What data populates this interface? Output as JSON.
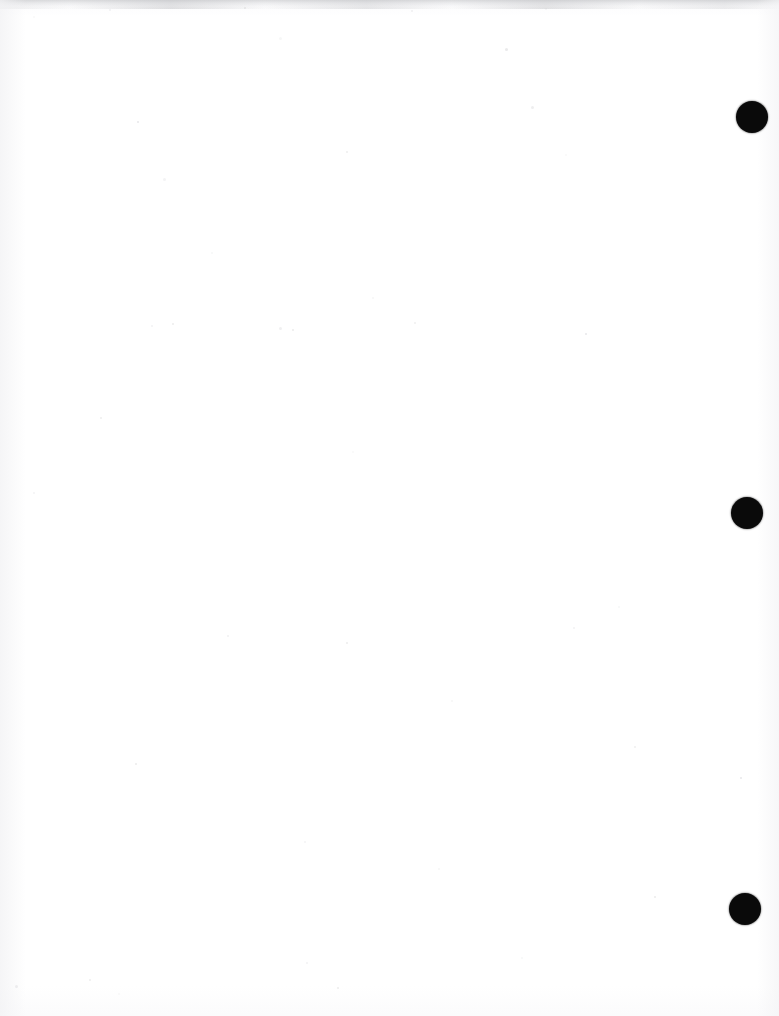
{
  "document": {
    "type": "scanned-page",
    "title": "Scanned Blank Page",
    "page_width": 779,
    "page_height": 1016,
    "background_color": "#ffffff",
    "body_text": "",
    "content_note": "Blank page — no printed text or figures"
  },
  "scan_artifacts": {
    "top_band": {
      "label": "top-edge-scan-band",
      "color": "#c4c5c8",
      "height": 9
    },
    "edge_shading_color": "#f2f2f4",
    "speck_color": "#b9babe",
    "specks": [
      {
        "x": 33,
        "y": 16,
        "size": 2
      },
      {
        "x": 109,
        "y": 9,
        "size": 2
      },
      {
        "x": 244,
        "y": 7,
        "size": 2
      },
      {
        "x": 279,
        "y": 37,
        "size": 3
      },
      {
        "x": 411,
        "y": 10,
        "size": 2
      },
      {
        "x": 505,
        "y": 48,
        "size": 3
      },
      {
        "x": 545,
        "y": 8,
        "size": 2
      },
      {
        "x": 531,
        "y": 106,
        "size": 3
      },
      {
        "x": 137,
        "y": 121,
        "size": 2
      },
      {
        "x": 163,
        "y": 178,
        "size": 3
      },
      {
        "x": 346,
        "y": 151,
        "size": 2
      },
      {
        "x": 565,
        "y": 154,
        "size": 2
      },
      {
        "x": 151,
        "y": 325,
        "size": 2
      },
      {
        "x": 172,
        "y": 323,
        "size": 2
      },
      {
        "x": 211,
        "y": 252,
        "size": 2
      },
      {
        "x": 279,
        "y": 327,
        "size": 3
      },
      {
        "x": 292,
        "y": 329,
        "size": 2
      },
      {
        "x": 372,
        "y": 297,
        "size": 2
      },
      {
        "x": 414,
        "y": 322,
        "size": 2
      },
      {
        "x": 585,
        "y": 333,
        "size": 2
      },
      {
        "x": 33,
        "y": 492,
        "size": 2
      },
      {
        "x": 100,
        "y": 417,
        "size": 2
      },
      {
        "x": 352,
        "y": 451,
        "size": 2
      },
      {
        "x": 573,
        "y": 627,
        "size": 2
      },
      {
        "x": 346,
        "y": 642,
        "size": 2
      },
      {
        "x": 618,
        "y": 606,
        "size": 2
      },
      {
        "x": 227,
        "y": 635,
        "size": 2
      },
      {
        "x": 135,
        "y": 763,
        "size": 2
      },
      {
        "x": 451,
        "y": 700,
        "size": 2
      },
      {
        "x": 634,
        "y": 746,
        "size": 2
      },
      {
        "x": 740,
        "y": 777,
        "size": 2
      },
      {
        "x": 304,
        "y": 841,
        "size": 2
      },
      {
        "x": 89,
        "y": 979,
        "size": 2
      },
      {
        "x": 118,
        "y": 993,
        "size": 2
      },
      {
        "x": 306,
        "y": 962,
        "size": 2
      },
      {
        "x": 337,
        "y": 987,
        "size": 2
      },
      {
        "x": 521,
        "y": 957,
        "size": 2
      },
      {
        "x": 15,
        "y": 985,
        "size": 3
      },
      {
        "x": 654,
        "y": 896,
        "size": 2
      },
      {
        "x": 438,
        "y": 868,
        "size": 2
      }
    ]
  },
  "punch_marks": {
    "label": "right-margin-punch-marks",
    "color": "#0a0a0a",
    "count": 3,
    "items": [
      {
        "name": "punch-mark-top",
        "cx": 752,
        "cy": 117,
        "diameter": 32
      },
      {
        "name": "punch-mark-middle",
        "cx": 747,
        "cy": 513,
        "diameter": 32
      },
      {
        "name": "punch-mark-bottom",
        "cx": 745,
        "cy": 909,
        "diameter": 32
      }
    ]
  }
}
